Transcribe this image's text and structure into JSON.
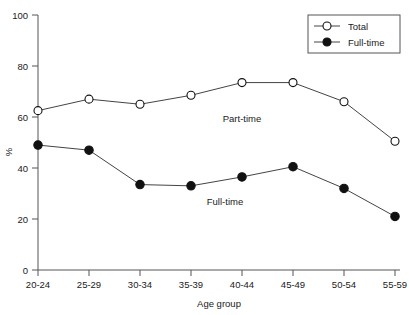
{
  "chart_data": {
    "type": "line",
    "title": "",
    "xlabel": "Age group",
    "ylabel": "%",
    "categories": [
      "20-24",
      "25-29",
      "30-34",
      "35-39",
      "40-44",
      "45-49",
      "50-54",
      "55-59"
    ],
    "series": [
      {
        "name": "Total",
        "marker": "open-circle",
        "values": [
          62.5,
          67,
          65,
          68.5,
          73.5,
          73.5,
          66,
          50.5
        ]
      },
      {
        "name": "Full-time",
        "marker": "filled-circle",
        "values": [
          49,
          47,
          33.5,
          33,
          36.5,
          40.5,
          32,
          21
        ]
      }
    ],
    "ylim": [
      0,
      100
    ],
    "yticks": [
      0,
      20,
      40,
      60,
      80,
      100
    ],
    "ytick_labels": [
      "0",
      "20",
      "40",
      "60",
      "80",
      "100"
    ],
    "grid": false,
    "legend_position": "top-right",
    "annotations": [
      {
        "text": "Part-time",
        "x_category": "40-44",
        "y_value": 58
      },
      {
        "text": "Full-time",
        "x_category": "40-44",
        "y_value": 24
      }
    ],
    "colors": {
      "line": "#444444",
      "marker_open_fill": "#ffffff",
      "marker_filled_fill": "#111111",
      "axis": "#555555",
      "text": "#1a1a1a",
      "background": "#ffffff"
    }
  },
  "legend": {
    "entries": [
      {
        "label": "Total",
        "marker": "open-circle"
      },
      {
        "label": "Full-time",
        "marker": "filled-circle"
      }
    ]
  },
  "axes": {
    "y_axis_label": "%",
    "x_axis_label": "Age group",
    "y_ticks": [
      "0",
      "20",
      "40",
      "60",
      "80",
      "100"
    ],
    "x_ticks": [
      "20-24",
      "25-29",
      "30-34",
      "35-39",
      "40-44",
      "45-49",
      "50-54",
      "55-59"
    ]
  },
  "annotations": {
    "part_time": "Part-time",
    "full_time": "Full-time"
  }
}
